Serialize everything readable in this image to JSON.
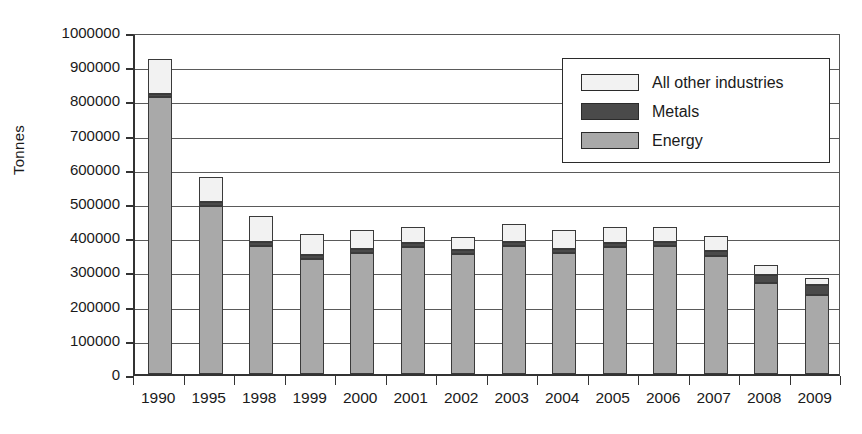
{
  "chart_data": {
    "type": "bar",
    "stacked": true,
    "title": "",
    "xlabel": "",
    "ylabel": "Tonnes",
    "ylim": [
      0,
      1000000
    ],
    "ytick_step": 100000,
    "ytick_labels": [
      "1000000",
      "900000",
      "800000",
      "700000",
      "600000",
      "500000",
      "400000",
      "300000",
      "200000",
      "100000",
      "0"
    ],
    "grid": true,
    "legend_position": "top-right",
    "categories": [
      "1990",
      "1995",
      "1998",
      "1999",
      "2000",
      "2001",
      "2002",
      "2003",
      "2004",
      "2005",
      "2006",
      "2007",
      "2008",
      "2009"
    ],
    "series": [
      {
        "name": "Energy",
        "color": "#a9a9a9",
        "values": [
          810000,
          490000,
          375000,
          335000,
          355000,
          370000,
          350000,
          375000,
          355000,
          370000,
          375000,
          345000,
          265000,
          230000
        ]
      },
      {
        "name": "Metals",
        "color": "#4a4a4a",
        "values": [
          10000,
          12000,
          12000,
          12000,
          12000,
          12000,
          12000,
          12000,
          12000,
          12000,
          12000,
          15000,
          25000,
          30000
        ]
      },
      {
        "name": "All other industries",
        "color": "#f2f2f2",
        "values": [
          100000,
          73000,
          75000,
          63000,
          53000,
          48000,
          38000,
          53000,
          53000,
          48000,
          43000,
          45000,
          30000,
          20000
        ]
      }
    ],
    "totals": [
      920000,
      575000,
      462000,
      410000,
      420000,
      430000,
      400000,
      440000,
      420000,
      430000,
      430000,
      405000,
      320000,
      280000
    ]
  },
  "legend": {
    "items": [
      {
        "label": "All other industries",
        "color": "#f2f2f2"
      },
      {
        "label": "Metals",
        "color": "#4a4a4a"
      },
      {
        "label": "Energy",
        "color": "#a9a9a9"
      }
    ]
  },
  "axis": {
    "y_title": "Tonnes"
  }
}
